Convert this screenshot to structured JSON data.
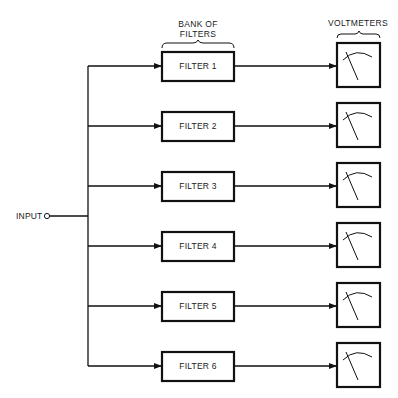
{
  "diagram": {
    "headers": {
      "filters_line1": "BANK OF",
      "filters_line2": "FILTERS",
      "voltmeters": "VOLTMETERS"
    },
    "input_label": "INPUT",
    "filters": [
      {
        "label": "FILTER 1"
      },
      {
        "label": "FILTER 2"
      },
      {
        "label": "FILTER 3"
      },
      {
        "label": "FILTER 4"
      },
      {
        "label": "FILTER 5"
      },
      {
        "label": "FILTER 6"
      }
    ],
    "voltmeter_count": 6,
    "colors": {
      "line": "#111111",
      "background": "#ffffff"
    }
  }
}
